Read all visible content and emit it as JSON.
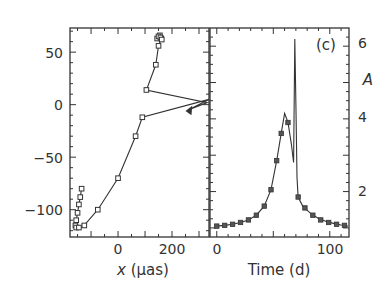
{
  "chart_data": [
    {
      "type": "line",
      "panel": "left",
      "title": "",
      "xlabel_var": "x",
      "xlabel_unit": " (µas)",
      "ylabel": "",
      "xlim": [
        -178,
        337
      ],
      "ylim": [
        -126,
        73
      ],
      "xticks": [
        0,
        200
      ],
      "xtick_labels": [
        "0",
        "200"
      ],
      "yticks": [
        50,
        0,
        -50,
        -100
      ],
      "ytick_labels": [
        "50",
        "0",
        "−50",
        "−100"
      ],
      "grid": false,
      "series": [
        {
          "name": "centroid trajectory",
          "x": [
            -135,
            -140,
            -145,
            -150,
            -155,
            -158,
            -155,
            -145,
            -125,
            -75,
            0,
            65,
            90,
            337,
            260,
            330,
            105,
            140,
            150,
            160,
            155,
            145,
            150,
            157,
            162
          ],
          "y": [
            -80,
            -88,
            -95,
            -103,
            -110,
            -115,
            -117,
            -117,
            -115,
            -100,
            -70,
            -30,
            -12,
            5,
            -5,
            2,
            14,
            38,
            56,
            63,
            66,
            63,
            65,
            64,
            62
          ],
          "marker": "square"
        }
      ]
    },
    {
      "type": "line",
      "panel": "right",
      "label": "(c)",
      "xlabel": "Time (d)",
      "ylabel": "A",
      "xlim": [
        -6,
        117
      ],
      "ylim": [
        0.75,
        6.5
      ],
      "xticks": [
        0,
        100
      ],
      "xtick_labels": [
        "0",
        "100"
      ],
      "yticks": [
        2,
        4,
        6
      ],
      "ytick_labels": [
        "2",
        "4",
        "6"
      ],
      "grid": false,
      "series": [
        {
          "name": "magnification",
          "x": [
            0,
            7,
            14,
            21,
            28,
            35,
            42,
            48,
            53,
            57,
            60,
            63,
            66,
            68,
            69,
            70,
            71,
            72,
            76,
            83,
            90,
            97,
            104,
            110,
            116
          ],
          "y": [
            1.05,
            1.07,
            1.1,
            1.15,
            1.22,
            1.35,
            1.6,
            2.05,
            2.85,
            3.6,
            4.15,
            3.9,
            3.3,
            2.8,
            6.2,
            4.4,
            2.4,
            1.85,
            1.6,
            1.4,
            1.26,
            1.18,
            1.12,
            1.08,
            1.05
          ],
          "marker_x": [
            0,
            7,
            14,
            21,
            28,
            35,
            42,
            48,
            53,
            57,
            63,
            72,
            78,
            85,
            92,
            99,
            106,
            113
          ],
          "marker_y": [
            1.05,
            1.07,
            1.1,
            1.15,
            1.22,
            1.35,
            1.6,
            2.05,
            2.85,
            3.6,
            3.9,
            1.85,
            1.55,
            1.35,
            1.22,
            1.15,
            1.1,
            1.07
          ],
          "marker": "square"
        }
      ]
    }
  ],
  "labels": {
    "panel_label": "(c)",
    "left_xlabel_var": "x",
    "left_xlabel_unit": " (µas)",
    "right_xlabel": "Time (d)",
    "right_ylabel": "A",
    "left_yticks": [
      "50",
      "0",
      "−50",
      "−100"
    ],
    "left_xticks": [
      "0",
      "200"
    ],
    "right_xticks": [
      "0",
      "100"
    ],
    "right_yticks": [
      "6",
      "4",
      "2"
    ]
  },
  "colors": {
    "line": "#333333",
    "frame": "#333333",
    "background": "#ffffff"
  }
}
